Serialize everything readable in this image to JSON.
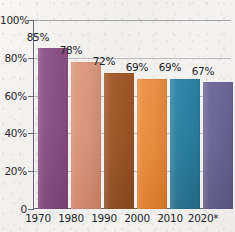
{
  "chart_data": {
    "type": "bar",
    "title": "",
    "xlabel": "",
    "ylabel": "",
    "categories": [
      "1970",
      "1980",
      "1990",
      "2000",
      "2010",
      "2020*"
    ],
    "values": [
      85,
      78,
      72,
      69,
      69,
      67
    ],
    "value_labels": [
      "85%",
      "78%",
      "72%",
      "69%",
      "69%",
      "67%"
    ],
    "ylim": [
      0,
      100
    ],
    "ytick_values": [
      0,
      20,
      40,
      60,
      80,
      100
    ],
    "ytick_labels": [
      "0",
      "20%",
      "40%",
      "60%",
      "80%",
      "100%"
    ],
    "grid": true,
    "legend": false,
    "bar_colors": [
      "#8a4f84",
      "#d9947a",
      "#9d5526",
      "#e88b3c",
      "#2a7e9e",
      "#6a6494"
    ],
    "series": [
      {
        "name": "value",
        "values": [
          85,
          78,
          72,
          69,
          69,
          67
        ]
      }
    ]
  },
  "axis": {
    "y_ticks": [
      {
        "label": "100%",
        "value": 100
      },
      {
        "label": "80%",
        "value": 80
      },
      {
        "label": "60%",
        "value": 60
      },
      {
        "label": "40%",
        "value": 40
      },
      {
        "label": "20%",
        "value": 20
      },
      {
        "label": "0",
        "value": 0
      }
    ]
  },
  "bars": [
    {
      "category": "1970",
      "value": 85,
      "label": "85%",
      "color": "#8a4f84"
    },
    {
      "category": "1980",
      "value": 78,
      "label": "78%",
      "color": "#d9947a"
    },
    {
      "category": "1990",
      "value": 72,
      "label": "72%",
      "color": "#9d5526"
    },
    {
      "category": "2000",
      "value": 69,
      "label": "69%",
      "color": "#e88b3c"
    },
    {
      "category": "2010",
      "value": 69,
      "label": "69%",
      "color": "#2a7e9e"
    },
    {
      "category": "2020*",
      "value": 67,
      "label": "67%",
      "color": "#6a6494"
    }
  ]
}
